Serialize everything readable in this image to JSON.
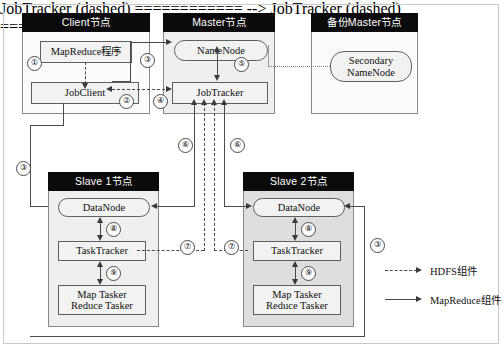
{
  "diagram": {
    "nodes": {
      "client": {
        "title": "Client节点",
        "boxes": {
          "mapreduce_program": "MapReduce程序",
          "jobclient": "JobClient"
        }
      },
      "master": {
        "title": "Master节点",
        "boxes": {
          "namenode": "NameNode",
          "jobtracker": "JobTracker"
        }
      },
      "backup_master": {
        "title": "备份Master节点",
        "boxes": {
          "secondary_namenode": "Secondary\nNameNode"
        }
      },
      "slave1": {
        "title": "Slave 1节点",
        "boxes": {
          "datanode": "DataNode",
          "tasktracker": "TaskTracker",
          "tasker": "Map Tasker\nReduce Tasker"
        }
      },
      "slave2": {
        "title": "Slave 2节点",
        "boxes": {
          "datanode": "DataNode",
          "tasktracker": "TaskTracker",
          "tasker": "Map Tasker\nReduce Tasker"
        }
      }
    },
    "steps": {
      "s1": "①",
      "s2": "②",
      "s3_top": "③",
      "s3_left": "③",
      "s3_right": "③",
      "s4": "④",
      "s5": "⑤",
      "s6_left": "⑥",
      "s6_right": "⑥",
      "s7_left": "⑦",
      "s7_right": "⑦",
      "s8_slave1": "⑧",
      "s8_slave2": "⑧",
      "s9_slave1": "⑨",
      "s9_slave2": "⑨"
    },
    "legend": {
      "hdfs": "HDFS组件",
      "mapreduce": "MapReduce组件"
    },
    "colors": {
      "title_bar": "#0b0b0b",
      "title_text": "#ffffff",
      "panel_light": "#fbfbfb",
      "panel_shaded": "#efefef",
      "panel_shaded_dark": "#dedede",
      "box_fill": "#f2f2f2",
      "line": "#4a4a4a"
    }
  }
}
